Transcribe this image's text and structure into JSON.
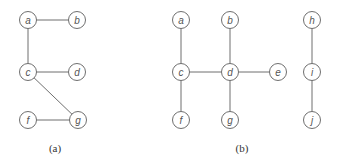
{
  "diagrams": [
    {
      "id": "a",
      "caption": "(a)",
      "caption_pos": [
        55,
        152
      ],
      "nodes": [
        {
          "label": "a",
          "x": 28,
          "y": 20
        },
        {
          "label": "b",
          "x": 77,
          "y": 20
        },
        {
          "label": "c",
          "x": 28,
          "y": 72
        },
        {
          "label": "d",
          "x": 77,
          "y": 72
        },
        {
          "label": "f",
          "x": 28,
          "y": 120
        },
        {
          "label": "g",
          "x": 78,
          "y": 120
        }
      ],
      "edges": [
        [
          "a",
          "b"
        ],
        [
          "a",
          "c"
        ],
        [
          "c",
          "d"
        ],
        [
          "c",
          "g"
        ],
        [
          "f",
          "g"
        ]
      ]
    },
    {
      "id": "b",
      "caption": "(b)",
      "caption_pos": [
        242,
        152
      ],
      "nodes": [
        {
          "label": "a",
          "x": 181,
          "y": 20
        },
        {
          "label": "b",
          "x": 230,
          "y": 20
        },
        {
          "label": "c",
          "x": 181,
          "y": 72
        },
        {
          "label": "d",
          "x": 230,
          "y": 72
        },
        {
          "label": "e",
          "x": 278,
          "y": 72
        },
        {
          "label": "f",
          "x": 181,
          "y": 120
        },
        {
          "label": "g",
          "x": 230,
          "y": 120
        },
        {
          "label": "h",
          "x": 312,
          "y": 20
        },
        {
          "label": "i",
          "x": 312,
          "y": 72
        },
        {
          "label": "j",
          "x": 312,
          "y": 120
        }
      ],
      "edges": [
        [
          "a",
          "c"
        ],
        [
          "c",
          "d"
        ],
        [
          "b",
          "d"
        ],
        [
          "d",
          "e"
        ],
        [
          "c",
          "f"
        ],
        [
          "d",
          "g"
        ],
        [
          "h",
          "i"
        ],
        [
          "i",
          "j"
        ]
      ]
    }
  ],
  "node_radius": 8.5
}
